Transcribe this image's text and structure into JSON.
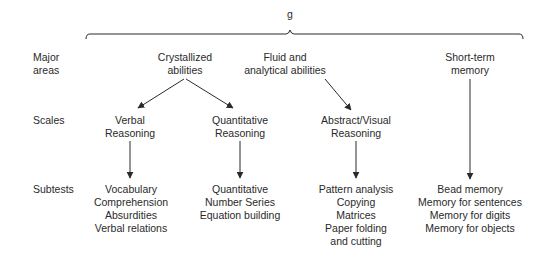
{
  "root": {
    "label": "g"
  },
  "row_labels": {
    "major_areas": [
      "Major",
      "areas"
    ],
    "scales": "Scales",
    "subtests": "Subtests"
  },
  "major_areas": [
    {
      "lines": [
        "Crystallized",
        "abilities"
      ]
    },
    {
      "lines": [
        "Fluid and",
        "analytical abilities"
      ]
    },
    {
      "lines": [
        "Short-term",
        "memory"
      ]
    }
  ],
  "scales": [
    {
      "lines": [
        "Verbal",
        "Reasoning"
      ]
    },
    {
      "lines": [
        "Quantitative",
        "Reasoning"
      ]
    },
    {
      "lines": [
        "Abstract/Visual",
        "Reasoning"
      ]
    }
  ],
  "subtests": [
    {
      "items": [
        "Vocabulary",
        "Comprehension",
        "Absurdities",
        "Verbal relations"
      ]
    },
    {
      "items": [
        "Quantitative",
        "Number Series",
        "Equation building"
      ]
    },
    {
      "items": [
        "Pattern analysis",
        "Copying",
        "Matrices",
        "Paper folding",
        "and cutting"
      ]
    },
    {
      "items": [
        "Bead memory",
        "Memory for sentences",
        "Memory for digits",
        "Memory for objects"
      ]
    }
  ],
  "colors": {
    "line": "#2a2a2a",
    "text": "#2a2a2a"
  }
}
